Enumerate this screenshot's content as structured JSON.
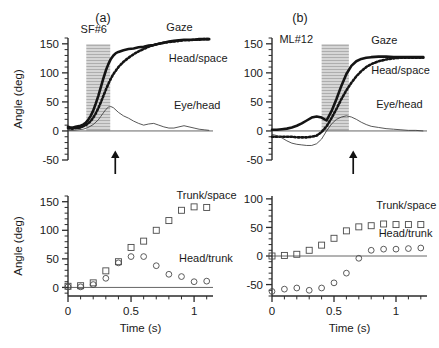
{
  "figure": {
    "panels": [
      {
        "letter": "(a)",
        "subject": "SF#6",
        "top": {
          "ylabel": "Angle (deg)",
          "yticks": [
            -50,
            0,
            50,
            100,
            150
          ],
          "traces": [
            {
              "name": "Gaze",
              "label": "Gaze"
            },
            {
              "name": "Head/space",
              "label": "Head/space"
            },
            {
              "name": "Eye/head",
              "label": "Eye/head"
            }
          ]
        },
        "bottom": {
          "ylabel": "Angle (deg)",
          "yticks": [
            0,
            50,
            100,
            150
          ],
          "xlabel": "Time (s)",
          "xticks": [
            0,
            0.5,
            1
          ],
          "series": [
            {
              "name": "Trunk/space",
              "label": "Trunk/space"
            },
            {
              "name": "Head/trunk",
              "label": "Head/trunk"
            }
          ]
        }
      },
      {
        "letter": "(b)",
        "subject": "ML#12",
        "top": {
          "ylabel": "",
          "yticks": [
            -50,
            0,
            50,
            100,
            150
          ],
          "traces": [
            {
              "name": "Gaze",
              "label": "Gaze"
            },
            {
              "name": "Head/space",
              "label": "Head/space"
            },
            {
              "name": "Eye/head",
              "label": "Eye/head"
            }
          ]
        },
        "bottom": {
          "ylabel": "",
          "yticks": [
            -50,
            0,
            50,
            100
          ],
          "xlabel": "Time (s)",
          "xticks": [
            0,
            0.5,
            1
          ],
          "series": [
            {
              "name": "Trunk/space",
              "label": "Trunk/space"
            },
            {
              "name": "Head/trunk",
              "label": "Head/trunk"
            }
          ]
        }
      }
    ]
  },
  "chart_data": [
    {
      "id": "panel-a-top",
      "type": "line",
      "title": "(a) SF#6 — gaze, head and eye trajectories",
      "xlabel": "Time (s)",
      "ylabel": "Angle (deg)",
      "xlim": [
        0,
        1.15
      ],
      "ylim": [
        -50,
        160
      ],
      "yticks": [
        -50,
        0,
        50,
        100,
        150
      ],
      "yminor_step": 10,
      "grid": false,
      "legend": "inline-annotations",
      "annotations": [
        {
          "text": "SF#6",
          "x": 0.1,
          "y": 168
        },
        {
          "text": "Gaze",
          "x": 0.78,
          "y": 172
        },
        {
          "text": "Head/space",
          "x": 0.8,
          "y": 118
        },
        {
          "text": "Eye/head",
          "x": 0.84,
          "y": 38
        }
      ],
      "shaded_band": {
        "x0": 0.145,
        "x1": 0.335,
        "hatch": "horizontal",
        "color": "#d2d2d2"
      },
      "marker_arrow": {
        "x": 0.375,
        "y": -30,
        "points": "up"
      },
      "series": [
        {
          "name": "Gaze",
          "style": "solid-thick",
          "x": [
            0.0,
            0.02,
            0.04,
            0.06,
            0.08,
            0.1,
            0.12,
            0.14,
            0.16,
            0.18,
            0.2,
            0.22,
            0.24,
            0.26,
            0.28,
            0.3,
            0.32,
            0.34,
            0.36,
            0.38,
            0.4,
            0.44,
            0.48,
            0.52,
            0.56,
            0.6,
            0.64,
            0.68,
            0.72,
            0.76,
            0.8,
            0.84,
            0.88,
            0.92,
            0.96,
            1.0,
            1.04,
            1.08,
            1.12
          ],
          "y": [
            7,
            6,
            6,
            7,
            8,
            9,
            11,
            14,
            19,
            26,
            35,
            47,
            60,
            75,
            90,
            104,
            115,
            124,
            130,
            134,
            136,
            139,
            141,
            142,
            144,
            145,
            147,
            148,
            150,
            152,
            154,
            155,
            156,
            157,
            157,
            157,
            158,
            158,
            158
          ]
        },
        {
          "name": "Head/space",
          "style": "dotted-thick",
          "x": [
            0.0,
            0.02,
            0.04,
            0.06,
            0.08,
            0.1,
            0.12,
            0.14,
            0.16,
            0.18,
            0.2,
            0.22,
            0.24,
            0.26,
            0.28,
            0.3,
            0.32,
            0.34,
            0.36,
            0.38,
            0.4,
            0.44,
            0.48,
            0.52,
            0.56,
            0.6,
            0.64,
            0.68,
            0.72,
            0.76,
            0.8,
            0.84,
            0.88,
            0.92,
            0.96,
            1.0,
            1.04,
            1.08,
            1.12
          ],
          "y": [
            5,
            4,
            4,
            5,
            5,
            6,
            8,
            10,
            13,
            17,
            23,
            30,
            39,
            49,
            60,
            71,
            81,
            90,
            98,
            104,
            110,
            119,
            126,
            132,
            137,
            141,
            145,
            148,
            150,
            152,
            153,
            154,
            155,
            156,
            156,
            157,
            157,
            158,
            158
          ]
        },
        {
          "name": "Eye/head",
          "style": "solid-thin",
          "x": [
            0.0,
            0.04,
            0.08,
            0.12,
            0.16,
            0.2,
            0.24,
            0.26,
            0.28,
            0.3,
            0.32,
            0.34,
            0.36,
            0.4,
            0.44,
            0.48,
            0.52,
            0.56,
            0.6,
            0.64,
            0.68,
            0.72,
            0.76,
            0.8,
            0.84,
            0.88,
            0.92,
            0.96,
            1.0,
            1.04,
            1.08,
            1.12
          ],
          "y": [
            1,
            1,
            2,
            3,
            6,
            11,
            19,
            25,
            31,
            37,
            41,
            42,
            40,
            32,
            26,
            22,
            17,
            13,
            10,
            12,
            13,
            10,
            7,
            5,
            5,
            7,
            9,
            7,
            5,
            3,
            2,
            1
          ]
        }
      ]
    },
    {
      "id": "panel-a-bottom",
      "type": "scatter",
      "title": "(a) SF#6 — trunk and head-on-trunk displacement",
      "xlabel": "Time (s)",
      "ylabel": "Angle (deg)",
      "xlim": [
        0,
        1.15
      ],
      "ylim": [
        -15,
        160
      ],
      "yticks": [
        0,
        50,
        100,
        150
      ],
      "xticks": [
        0,
        0.5,
        1
      ],
      "xminor_step": 0.1,
      "grid": false,
      "annotations": [
        {
          "text": "Trunk/space",
          "x": 0.86,
          "y": 155
        },
        {
          "text": "Head/trunk",
          "x": 0.88,
          "y": 45
        }
      ],
      "series": [
        {
          "name": "Trunk/space",
          "marker": "open-square",
          "x": [
            0.0,
            0.1,
            0.2,
            0.3,
            0.4,
            0.5,
            0.6,
            0.7,
            0.8,
            0.9,
            1.0,
            1.1
          ],
          "y": [
            2,
            3,
            8,
            29,
            45,
            70,
            81,
            100,
            117,
            135,
            141,
            140
          ]
        },
        {
          "name": "Head/trunk",
          "marker": "open-circle",
          "x": [
            0.0,
            0.1,
            0.2,
            0.3,
            0.4,
            0.5,
            0.6,
            0.7,
            0.8,
            0.9,
            1.0,
            1.1
          ],
          "y": [
            1,
            1,
            5,
            16,
            43,
            54,
            54,
            38,
            23,
            19,
            10,
            11
          ]
        }
      ]
    },
    {
      "id": "panel-b-top",
      "type": "line",
      "title": "(b) ML#12 — gaze, head and eye trajectories",
      "xlabel": "Time (s)",
      "ylabel": "Angle (deg)",
      "xlim": [
        0,
        1.25
      ],
      "ylim": [
        -50,
        160
      ],
      "yticks": [
        -50,
        0,
        50,
        100,
        150
      ],
      "yminor_step": 10,
      "grid": false,
      "annotations": [
        {
          "text": "ML#12",
          "x": 0.06,
          "y": 152
        },
        {
          "text": "Gaze",
          "x": 0.8,
          "y": 150
        },
        {
          "text": "Head/space",
          "x": 0.8,
          "y": 98
        },
        {
          "text": "Eye/head",
          "x": 0.84,
          "y": 40
        }
      ],
      "shaded_band": {
        "x0": 0.4,
        "x1": 0.62,
        "hatch": "horizontal",
        "color": "#d2d2d2"
      },
      "marker_arrow": {
        "x": 0.655,
        "y": -30,
        "points": "up"
      },
      "series": [
        {
          "name": "Gaze",
          "style": "solid-thick",
          "x": [
            0.0,
            0.04,
            0.08,
            0.12,
            0.16,
            0.2,
            0.24,
            0.28,
            0.32,
            0.36,
            0.4,
            0.44,
            0.48,
            0.52,
            0.56,
            0.6,
            0.64,
            0.68,
            0.72,
            0.76,
            0.8,
            0.86,
            0.92,
            0.98,
            1.04,
            1.1,
            1.16,
            1.22
          ],
          "y": [
            2,
            2,
            3,
            4,
            6,
            9,
            13,
            18,
            23,
            25,
            23,
            18,
            34,
            55,
            78,
            98,
            112,
            120,
            124,
            126,
            127,
            128,
            128,
            127,
            127,
            127,
            127,
            127
          ]
        },
        {
          "name": "Head/space",
          "style": "dotted-thick",
          "x": [
            0.0,
            0.04,
            0.08,
            0.12,
            0.16,
            0.2,
            0.24,
            0.28,
            0.32,
            0.36,
            0.4,
            0.44,
            0.48,
            0.52,
            0.56,
            0.6,
            0.64,
            0.68,
            0.72,
            0.76,
            0.8,
            0.86,
            0.92,
            0.98,
            1.04,
            1.1,
            1.16,
            1.22
          ],
          "y": [
            -10,
            -10,
            -10,
            -10,
            -10,
            -11,
            -11,
            -11,
            -10,
            -8,
            -2,
            8,
            22,
            38,
            55,
            70,
            83,
            94,
            103,
            110,
            115,
            120,
            123,
            125,
            126,
            126,
            126,
            126
          ]
        },
        {
          "name": "Eye/head",
          "style": "solid-thin",
          "x": [
            0.0,
            0.04,
            0.08,
            0.12,
            0.16,
            0.2,
            0.24,
            0.28,
            0.32,
            0.36,
            0.4,
            0.44,
            0.48,
            0.52,
            0.56,
            0.6,
            0.64,
            0.68,
            0.72,
            0.76,
            0.8,
            0.86,
            0.92,
            0.98,
            1.04,
            1.1,
            1.16,
            1.22
          ],
          "y": [
            -6,
            -8,
            -12,
            -17,
            -21,
            -23,
            -24,
            -25,
            -25,
            -22,
            -14,
            0,
            12,
            20,
            24,
            26,
            24,
            20,
            15,
            11,
            8,
            6,
            4,
            3,
            2,
            1,
            1,
            0
          ]
        }
      ]
    },
    {
      "id": "panel-b-bottom",
      "type": "scatter",
      "title": "(b) ML#12 — trunk and head-on-trunk displacement",
      "xlabel": "Time (s)",
      "ylabel": "Angle (deg)",
      "xlim": [
        0,
        1.25
      ],
      "ylim": [
        -70,
        105
      ],
      "yticks": [
        -50,
        0,
        50,
        100
      ],
      "xticks": [
        0,
        0.5,
        1
      ],
      "xminor_step": 0.1,
      "grid": false,
      "annotations": [
        {
          "text": "Trunk/space",
          "x": 0.84,
          "y": 82
        },
        {
          "text": "Head/trunk",
          "x": 0.86,
          "y": 33
        }
      ],
      "series": [
        {
          "name": "Trunk/space",
          "marker": "open-square",
          "x": [
            0.0,
            0.1,
            0.2,
            0.3,
            0.4,
            0.5,
            0.6,
            0.7,
            0.8,
            0.9,
            1.0,
            1.1,
            1.2
          ],
          "y": [
            0,
            1,
            3,
            10,
            19,
            31,
            44,
            51,
            53,
            56,
            55,
            55,
            55
          ]
        },
        {
          "name": "Head/trunk",
          "marker": "open-circle",
          "x": [
            0.0,
            0.1,
            0.2,
            0.3,
            0.4,
            0.5,
            0.6,
            0.7,
            0.8,
            0.9,
            1.0,
            1.1,
            1.2
          ],
          "y": [
            -62,
            -58,
            -56,
            -60,
            -56,
            -47,
            -30,
            -4,
            10,
            12,
            12,
            13,
            14
          ]
        }
      ]
    }
  ]
}
